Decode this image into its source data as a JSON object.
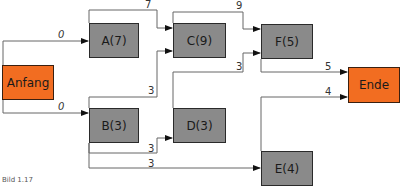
{
  "diagram": {
    "type": "network-plan",
    "nodes": {
      "start": {
        "label": "Anfang",
        "kind": "terminal"
      },
      "A": {
        "label": "A(7)",
        "duration": 7
      },
      "B": {
        "label": "B(3)",
        "duration": 3
      },
      "C": {
        "label": "C(9)",
        "duration": 9
      },
      "D": {
        "label": "D(3)",
        "duration": 3
      },
      "E": {
        "label": "E(4)",
        "duration": 4
      },
      "F": {
        "label": "F(5)",
        "duration": 5
      },
      "end": {
        "label": "Ende",
        "kind": "terminal"
      }
    },
    "edges": {
      "start_A": {
        "from": "Anfang",
        "to": "A",
        "weight": "0"
      },
      "start_B": {
        "from": "Anfang",
        "to": "B",
        "weight": "0"
      },
      "A_C": {
        "from": "A",
        "to": "C",
        "weight": "7"
      },
      "B_C": {
        "from": "B",
        "to": "C",
        "weight": "3"
      },
      "B_D": {
        "from": "B",
        "to": "D",
        "weight": "3"
      },
      "B_E": {
        "from": "B",
        "to": "E",
        "weight": "3"
      },
      "C_F": {
        "from": "C",
        "to": "F",
        "weight": "9"
      },
      "D_F": {
        "from": "D",
        "to": "F",
        "weight": "3"
      },
      "F_end": {
        "from": "F",
        "to": "Ende",
        "weight": "5"
      },
      "E_end": {
        "from": "E",
        "to": "Ende",
        "weight": "4"
      }
    },
    "colors": {
      "terminal": "#f26d21",
      "task": "#8a8a8a",
      "line": "#555555"
    },
    "caption": "Bild 1.17"
  }
}
